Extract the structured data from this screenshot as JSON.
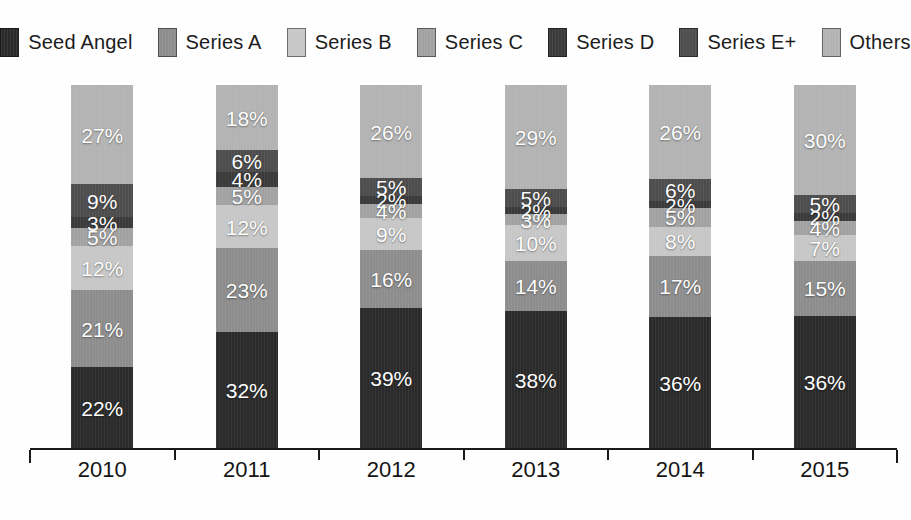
{
  "chart_data": {
    "type": "bar",
    "stacked": true,
    "normalized_to_100": true,
    "title": "",
    "xlabel": "",
    "ylabel": "",
    "legend_position": "top",
    "grid": false,
    "value_suffix": "%",
    "label_color": "#ffffff",
    "axis_color": "#1a1a1a",
    "background": "#fefefe",
    "categories": [
      "2010",
      "2011",
      "2012",
      "2013",
      "2014",
      "2015"
    ],
    "series": [
      {
        "name": "Seed Angel",
        "color": "#2a2a2a",
        "values": [
          22,
          32,
          39,
          38,
          36,
          36
        ]
      },
      {
        "name": "Series A",
        "color": "#8d8d8d",
        "values": [
          21,
          23,
          16,
          14,
          17,
          15
        ]
      },
      {
        "name": "Series B",
        "color": "#c7c7c7",
        "values": [
          12,
          12,
          9,
          10,
          8,
          7
        ]
      },
      {
        "name": "Series C",
        "color": "#a2a2a2",
        "values": [
          5,
          5,
          4,
          3,
          5,
          4
        ]
      },
      {
        "name": "Series D",
        "color": "#3a3a3a",
        "values": [
          3,
          4,
          2,
          2,
          2,
          2
        ]
      },
      {
        "name": "Series E+",
        "color": "#4d4d4d",
        "values": [
          9,
          6,
          5,
          5,
          6,
          5
        ]
      },
      {
        "name": "Others",
        "color": "#b3b3b3",
        "values": [
          27,
          18,
          26,
          29,
          26,
          30
        ]
      }
    ]
  }
}
